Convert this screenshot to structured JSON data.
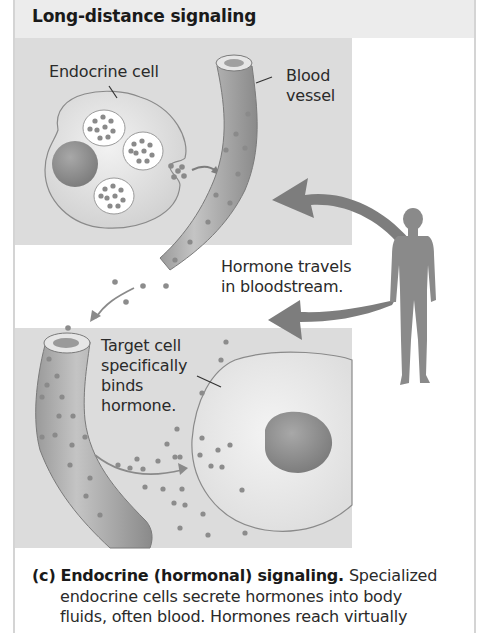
{
  "figure": {
    "title": "Long-distance signaling",
    "labels": {
      "endocrine_cell": "Endocrine cell",
      "blood_vessel_line1": "Blood",
      "blood_vessel_line2": "vessel",
      "hormone_travels_line1": "Hormone travels",
      "hormone_travels_line2": "in bloodstream.",
      "target_cell_line1": "Target cell",
      "target_cell_line2": "specifically",
      "target_cell_line3": "binds",
      "target_cell_line4": "hormone."
    },
    "icons": [
      "endocrine-cell-icon",
      "blood-vessel-icon",
      "human-silhouette-icon",
      "target-cell-icon",
      "curved-arrow-icon",
      "hormone-dot-icon"
    ],
    "colors": {
      "panel_bg": "#dcdcdc",
      "header_bg": "#ececec",
      "arrow": "#7d7d7d",
      "silhouette": "#8a8a8a",
      "hormone_dot": "#8c8c8c",
      "nucleus": "#8f8f8f"
    }
  },
  "caption": {
    "label": "(c)",
    "bold_title": "Endocrine (hormonal) signaling.",
    "line1_rest": "Specialized",
    "line2": "endocrine cells secrete hormones into body",
    "line3": "fluids, often blood. Hormones reach virtually"
  }
}
